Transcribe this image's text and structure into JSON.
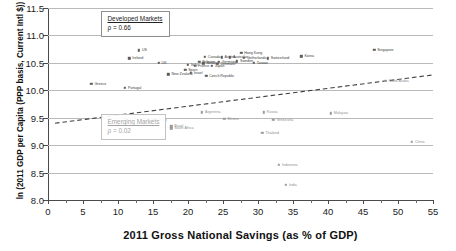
{
  "chart_data": {
    "type": "scatter",
    "title": "",
    "xlabel": "2011 Gross National Savings (as % of GDP)",
    "ylabel": "ln (2011 GDP per Capita (PPP basis, Current Intl $))",
    "xlim": [
      0,
      55
    ],
    "ylim": [
      8.0,
      11.5
    ],
    "xticks": [
      0,
      5,
      10,
      15,
      20,
      25,
      30,
      35,
      40,
      45,
      50,
      55
    ],
    "yticks": [
      8.0,
      8.5,
      9.0,
      9.5,
      10.0,
      10.5,
      11.0,
      11.5
    ],
    "ytick_labels": [
      "8.0",
      "8.5",
      "9.0",
      "9.5",
      "10.0",
      "10.5",
      "11.0",
      "11.5"
    ],
    "xtick_labels": [
      "0",
      "5",
      "10",
      "15",
      "20",
      "25",
      "30",
      "35",
      "40",
      "45",
      "50",
      "55"
    ],
    "grid": "horizontal",
    "legend_position": "none",
    "annotations": [
      {
        "id": "developed",
        "title": "Developed Markets",
        "rho_label": "ρ = 0.66",
        "x": 7.5,
        "y": 11.28
      },
      {
        "id": "emerging",
        "title": "Emerging Markets",
        "rho_label": "ρ = 0.02",
        "x": 7.5,
        "y": 9.4
      }
    ],
    "trendline": {
      "style": "dashed",
      "x0": 1.0,
      "y0": 9.4,
      "x1": 55.0,
      "y1": 10.28
    },
    "series": [
      {
        "name": "Developed Markets",
        "color": "#5b5b5b",
        "points": [
          {
            "label": "Greece",
            "x": 6.2,
            "y": 10.12,
            "lp": "right"
          },
          {
            "label": "Portugal",
            "x": 11.0,
            "y": 10.05,
            "lp": "right"
          },
          {
            "label": "US",
            "x": 13.0,
            "y": 10.73,
            "lp": "right"
          },
          {
            "label": "Ireland",
            "x": 11.6,
            "y": 10.58,
            "lp": "right"
          },
          {
            "label": "UK",
            "x": 15.8,
            "y": 10.5,
            "lp": "right"
          },
          {
            "label": "New Zealand",
            "x": 17.2,
            "y": 10.29,
            "lp": "right"
          },
          {
            "label": "Spain",
            "x": 19.6,
            "y": 10.37,
            "lp": "right"
          },
          {
            "label": "Italy",
            "x": 20.0,
            "y": 10.46,
            "lp": "right"
          },
          {
            "label": "Israel",
            "x": 20.4,
            "y": 10.32,
            "lp": "right"
          },
          {
            "label": "France",
            "x": 21.0,
            "y": 10.45,
            "lp": "right"
          },
          {
            "label": "Belgium",
            "x": 21.6,
            "y": 10.52,
            "lp": "right"
          },
          {
            "label": "Finland",
            "x": 22.2,
            "y": 10.49,
            "lp": "right"
          },
          {
            "label": "Canada",
            "x": 22.4,
            "y": 10.61,
            "lp": "right"
          },
          {
            "label": "Czech Republic",
            "x": 22.6,
            "y": 10.26,
            "lp": "right"
          },
          {
            "label": "Japan",
            "x": 23.4,
            "y": 10.45,
            "lp": "right"
          },
          {
            "label": "Denmark",
            "x": 24.2,
            "y": 10.48,
            "lp": "right"
          },
          {
            "label": "Germany",
            "x": 24.4,
            "y": 10.52,
            "lp": "right"
          },
          {
            "label": "Austria",
            "x": 24.8,
            "y": 10.6,
            "lp": "right"
          },
          {
            "label": "Australia",
            "x": 26.0,
            "y": 10.6,
            "lp": "right"
          },
          {
            "label": "Hong Kong",
            "x": 27.6,
            "y": 10.68,
            "lp": "right"
          },
          {
            "label": "Sweden",
            "x": 27.0,
            "y": 10.53,
            "lp": "right"
          },
          {
            "label": "Netherlands",
            "x": 28.0,
            "y": 10.59,
            "lp": "right"
          },
          {
            "label": "Taiwan",
            "x": 29.4,
            "y": 10.5,
            "lp": "right"
          },
          {
            "label": "Switzerland",
            "x": 31.4,
            "y": 10.58,
            "lp": "right"
          },
          {
            "label": "Korea",
            "x": 36.2,
            "y": 10.62,
            "lp": "right"
          },
          {
            "label": "Singapore",
            "x": 46.6,
            "y": 10.74,
            "lp": "right"
          }
        ]
      },
      {
        "name": "Emerging Markets",
        "color": "#9a9a9a",
        "points": [
          {
            "label": "Turkey",
            "x": 15.0,
            "y": 9.46,
            "lp": "right"
          },
          {
            "label": "Brazil",
            "x": 17.6,
            "y": 9.34,
            "lp": "right"
          },
          {
            "label": "South Africa",
            "x": 17.6,
            "y": 9.31,
            "lp": "right"
          },
          {
            "label": "Argentina",
            "x": 22.0,
            "y": 9.6,
            "lp": "right"
          },
          {
            "label": "Mexico",
            "x": 25.2,
            "y": 9.48,
            "lp": "right"
          },
          {
            "label": "Russia",
            "x": 30.8,
            "y": 9.6,
            "lp": "right"
          },
          {
            "label": "Venezuela",
            "x": 32.2,
            "y": 9.46,
            "lp": "right"
          },
          {
            "label": "Thailand",
            "x": 30.6,
            "y": 9.22,
            "lp": "right"
          },
          {
            "label": "Indonesia",
            "x": 33.0,
            "y": 8.64,
            "lp": "right"
          },
          {
            "label": "India",
            "x": 34.0,
            "y": 8.28,
            "lp": "right"
          },
          {
            "label": "Saudi Arabia",
            "x": 48.2,
            "y": 10.17,
            "lp": "right"
          },
          {
            "label": "Malaysia",
            "x": 40.4,
            "y": 9.58,
            "lp": "right"
          },
          {
            "label": "China",
            "x": 52.0,
            "y": 9.06,
            "lp": "right"
          }
        ]
      }
    ]
  }
}
